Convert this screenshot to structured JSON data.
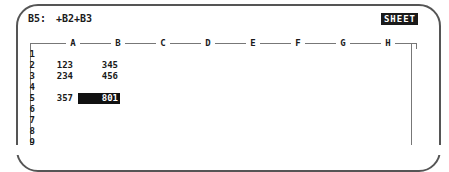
{
  "device": {
    "type": "pocket-organizer-lcd",
    "bezel_color": "#555555",
    "screen_bg": "#ffffff",
    "text_color": "#1a1a1a"
  },
  "statusbar": {
    "cell_reference": "B5:",
    "formula": "+B2+B3",
    "mode_indicator": "SHEET",
    "mode_indicator_inverse": true
  },
  "grid": {
    "columns": [
      "A",
      "B",
      "C",
      "D",
      "E",
      "F",
      "G",
      "H"
    ],
    "column_x": [
      43,
      88,
      133,
      178,
      223,
      268,
      313,
      358
    ],
    "rows": [
      "1",
      "2",
      "3",
      "4",
      "5",
      "6",
      "7",
      "8",
      "9"
    ],
    "cells": [
      {
        "row": "1",
        "values": {
          "A": "",
          "B": ""
        }
      },
      {
        "row": "2",
        "values": {
          "A": "123",
          "B": "345"
        }
      },
      {
        "row": "3",
        "values": {
          "A": "234",
          "B": "456"
        }
      },
      {
        "row": "4",
        "values": {
          "A": "",
          "B": ""
        }
      },
      {
        "row": "5",
        "values": {
          "A": "357",
          "B": "801"
        }
      },
      {
        "row": "6",
        "values": {
          "A": "",
          "B": ""
        }
      },
      {
        "row": "7",
        "values": {
          "A": "",
          "B": ""
        }
      },
      {
        "row": "8",
        "values": {
          "A": "",
          "B": ""
        }
      },
      {
        "row": "9",
        "values": {
          "A": "",
          "B": ""
        }
      }
    ],
    "selected_cell": {
      "column": "B",
      "row": "5",
      "value": "801"
    }
  }
}
